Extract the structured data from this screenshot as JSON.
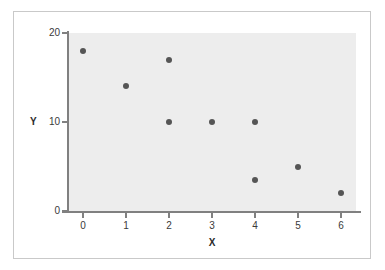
{
  "chart_data": {
    "type": "scatter",
    "title": "",
    "xlabel": "X",
    "ylabel": "Y",
    "xlim": [
      -0.35,
      6.35
    ],
    "ylim": [
      0,
      20
    ],
    "xticks": [
      "0",
      "1",
      "2",
      "3",
      "4",
      "5",
      "6"
    ],
    "xtick_values": [
      0,
      1,
      2,
      3,
      4,
      5,
      6
    ],
    "yticks": [
      "0",
      "10",
      "20"
    ],
    "ytick_values": [
      0,
      10,
      20
    ],
    "grid": false,
    "legend": null,
    "points": [
      {
        "x": 0,
        "y": 18
      },
      {
        "x": 1,
        "y": 14
      },
      {
        "x": 2,
        "y": 17
      },
      {
        "x": 2,
        "y": 10
      },
      {
        "x": 3,
        "y": 10
      },
      {
        "x": 4,
        "y": 10
      },
      {
        "x": 4,
        "y": 3.5
      },
      {
        "x": 5,
        "y": 5
      },
      {
        "x": 6,
        "y": 2
      }
    ],
    "marker": {
      "shape": "circle",
      "color": "#555555",
      "size_px": 6
    },
    "colors": {
      "plot_background": "#ededed",
      "figure_background": "#ffffff",
      "axis_line": "#808080",
      "frame_border": "#c9c9c9",
      "tick_label": "#3a3a3a",
      "axis_title": "#2b2b2b"
    }
  }
}
